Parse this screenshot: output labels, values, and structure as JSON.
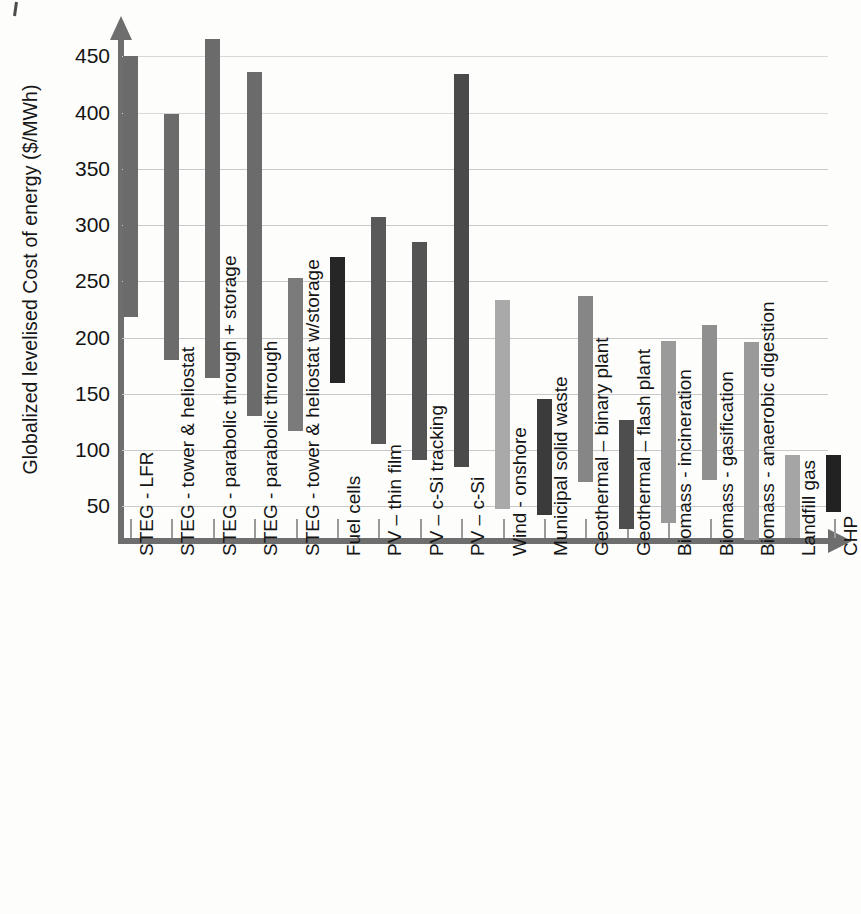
{
  "chart_data": {
    "type": "bar",
    "subtype": "floating-range-bar",
    "title": "",
    "xlabel": "",
    "ylabel": "Globalized levelised Cost of energy ($/MWh)",
    "ylim": [
      0,
      470
    ],
    "yticks": [
      50,
      100,
      150,
      200,
      250,
      300,
      350,
      400,
      450
    ],
    "ytick_labels": [
      "50",
      "100",
      "150",
      "200",
      "250",
      "300",
      "350",
      "400",
      "450"
    ],
    "grid": true,
    "legend": "none",
    "units": "$/MWh",
    "value_description": "Each bar spans the low to high levelised cost of energy for that technology.",
    "categories": [
      "STEG - LFR",
      "STEG - tower & heliostat",
      "STEG - parabolic through + storage",
      "STEG - parabolic through",
      "STEG - tower & heliostat w/storage",
      "Fuel cells",
      "PV – thin film",
      "PV – c-Si tracking",
      "PV – c-Si",
      "Wind - onshore",
      "Municipal solid waste",
      "Geothermal – binary plant",
      "Geothermal – flash plant",
      "Biomass - incineration",
      "Biomass - gasification",
      "Biomass - anaerobic digestion",
      "Landfill gas",
      "CHP"
    ],
    "low": [
      218,
      180,
      164,
      130,
      117,
      160,
      105,
      91,
      85,
      48,
      42,
      72,
      30,
      35,
      73,
      20,
      22,
      45
    ],
    "high": [
      450,
      399,
      465,
      436,
      253,
      272,
      307,
      285,
      434,
      233,
      145,
      237,
      127,
      197,
      211,
      196,
      96,
      96
    ],
    "colors": [
      "#6b6b6b",
      "#6b6b6b",
      "#6b6b6b",
      "#6b6b6b",
      "#7b7b7b",
      "#262626",
      "#595959",
      "#545454",
      "#4a4a4a",
      "#a9a9a9",
      "#3b3b3b",
      "#868686",
      "#4e4e4e",
      "#9a9a9a",
      "#8f8f8f",
      "#9a9a9a",
      "#a5a5a5",
      "#222222"
    ]
  }
}
